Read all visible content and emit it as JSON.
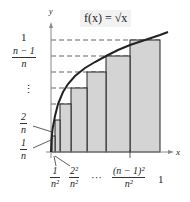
{
  "figure": {
    "function_label": "f(x) = √x",
    "axis_x_label": "x",
    "axis_y_label": "y",
    "y_labels": {
      "top": {
        "text": "1"
      },
      "second": {
        "num": "n − 1",
        "den": "n"
      },
      "dots": "⋮",
      "two": {
        "num": "2",
        "den": "n"
      },
      "one": {
        "num": "1",
        "den": "n"
      }
    },
    "x_labels": {
      "first": {
        "num": "1",
        "den": "n²"
      },
      "second": {
        "num": "2²",
        "den": "n²"
      },
      "dots": "···",
      "penultimate": {
        "num": "(n − 1)²",
        "den": "n²"
      },
      "last": {
        "text": "1"
      }
    },
    "colors": {
      "fill": "#d4d4d4",
      "curve": "#222222",
      "dash": "#666666"
    }
  }
}
